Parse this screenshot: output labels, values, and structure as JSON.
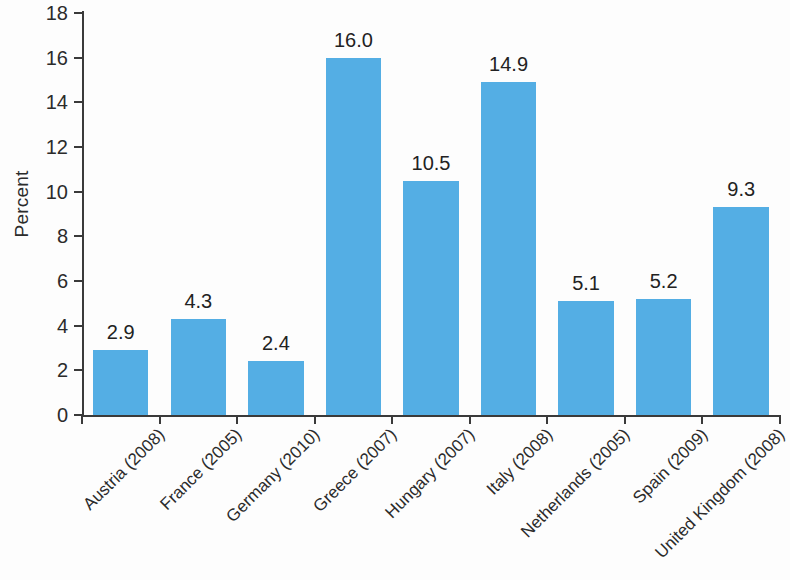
{
  "chart_data": {
    "type": "bar",
    "title": "",
    "subtitle": "",
    "xlabel": "",
    "ylabel": "Percent",
    "ylim": [
      0,
      18
    ],
    "ytick_step": 2,
    "yticks": [
      "18",
      "16",
      "14",
      "12",
      "10",
      "8",
      "6",
      "4",
      "2",
      "0"
    ],
    "grid": false,
    "legend": false,
    "bar_color": "#54aee4",
    "text_color": "#2b2b2b",
    "background": "#fdfdfd",
    "categories": [
      "Austria (2008)",
      "France (2005)",
      "Germany (2010)",
      "Greece (2007)",
      "Hungary (2007)",
      "Italy (2008)",
      "Netherlands (2005)",
      "Spain (2009)",
      "United Kingdom (2008)"
    ],
    "values": [
      2.9,
      4.3,
      2.4,
      16.0,
      10.5,
      14.9,
      5.1,
      5.2,
      9.3
    ],
    "value_labels": [
      "2.9",
      "4.3",
      "2.4",
      "16.0",
      "10.5",
      "14.9",
      "5.1",
      "5.2",
      "9.3"
    ]
  }
}
